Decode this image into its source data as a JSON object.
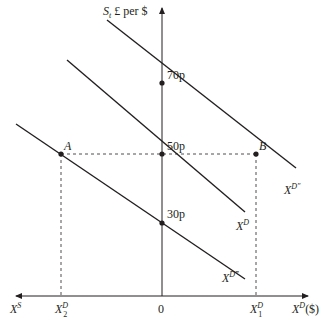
{
  "diagram": {
    "y_axis_label": {
      "main": "S",
      "sub": "t",
      "rest": " £ per $"
    },
    "x_axis_right_label": {
      "main": "X",
      "sup": "D",
      "rest": "($)"
    },
    "x_axis_left_label": {
      "main": "X",
      "sup": "S"
    },
    "origin_label": "0",
    "y_ticks": [
      "70p",
      "50p",
      "30p"
    ],
    "x_tick_1": {
      "main": "X",
      "sup": "D",
      "sub": "1"
    },
    "x_tick_2": {
      "main": "X",
      "sup": "D",
      "sub": "2"
    },
    "points": {
      "a": "A",
      "b": "B"
    },
    "curves": [
      {
        "name": "X",
        "sup": "D″",
        "position": "upper"
      },
      {
        "name": "X",
        "sup": "D",
        "position": "middle"
      },
      {
        "name": "X",
        "sup": "D‴",
        "position": "lower"
      }
    ],
    "colors": {
      "line": "#231f20",
      "background": "#ffffff"
    }
  }
}
